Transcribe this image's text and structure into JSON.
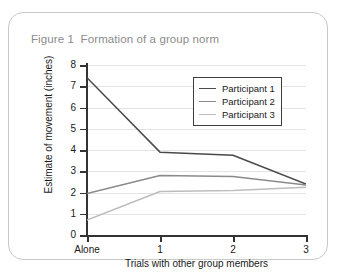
{
  "figure": {
    "title": "Figure 1  Formation of a group norm"
  },
  "legend": {
    "position": "top-right-inside",
    "items": [
      {
        "label": "Participant 1",
        "color": "#4a4a4a"
      },
      {
        "label": "Participant 2",
        "color": "#8a8a8a"
      },
      {
        "label": "Participant 3",
        "color": "#bdbdbd"
      }
    ]
  },
  "chart_data": {
    "type": "line",
    "title": "Figure 1  Formation of a group norm",
    "xlabel": "Trials with other group members",
    "ylabel": "Estimate of movement (inches)",
    "categories": [
      "Alone",
      "1",
      "2",
      "3"
    ],
    "xtick_labels": [
      "Alone",
      "1",
      "2",
      "3"
    ],
    "ytick_labels": [
      "0",
      "1",
      "2",
      "3",
      "4",
      "5",
      "6",
      "7",
      "8"
    ],
    "ylim": [
      0,
      8
    ],
    "ytick_step": 1,
    "grid": "horizontal",
    "legend_position": "top-right-inside",
    "series": [
      {
        "name": "Participant 1",
        "color": "#4a4a4a",
        "values": [
          7.4,
          3.9,
          3.75,
          2.4
        ]
      },
      {
        "name": "Participant 2",
        "color": "#8a8a8a",
        "values": [
          1.95,
          2.8,
          2.75,
          2.35
        ]
      },
      {
        "name": "Participant 3",
        "color": "#bdbdbd",
        "values": [
          0.7,
          2.05,
          2.1,
          2.25
        ]
      }
    ]
  }
}
